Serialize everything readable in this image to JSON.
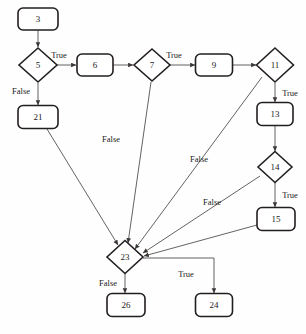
{
  "diagram": {
    "type": "control-flow-graph",
    "background_color": "#fefefe",
    "node_stroke_color": "#231f20",
    "edge_stroke_color": "#55514f",
    "nodes": [
      {
        "id": "n3",
        "label": "3",
        "shape": "rounded-rect",
        "cx": 38,
        "cy": 19,
        "w": 40,
        "h": 22
      },
      {
        "id": "n5",
        "label": "5",
        "shape": "diamond",
        "cx": 38,
        "cy": 65,
        "w": 38,
        "h": 34
      },
      {
        "id": "n21",
        "label": "21",
        "shape": "rounded-rect",
        "cx": 38,
        "cy": 117,
        "w": 40,
        "h": 23
      },
      {
        "id": "n6",
        "label": "6",
        "shape": "rounded-rect",
        "cx": 95,
        "cy": 65,
        "w": 36,
        "h": 22
      },
      {
        "id": "n7",
        "label": "7",
        "shape": "diamond",
        "cx": 152,
        "cy": 65,
        "w": 36,
        "h": 32
      },
      {
        "id": "n9",
        "label": "9",
        "shape": "rounded-rect",
        "cx": 214,
        "cy": 65,
        "w": 37,
        "h": 22
      },
      {
        "id": "n11",
        "label": "11",
        "shape": "diamond",
        "cx": 275,
        "cy": 65,
        "w": 37,
        "h": 34
      },
      {
        "id": "n13",
        "label": "13",
        "shape": "rounded-rect",
        "cx": 275,
        "cy": 114,
        "w": 36,
        "h": 23
      },
      {
        "id": "n14",
        "label": "14",
        "shape": "diamond",
        "cx": 275,
        "cy": 167,
        "w": 34,
        "h": 31
      },
      {
        "id": "n15",
        "label": "15",
        "shape": "rounded-rect",
        "cx": 276,
        "cy": 219,
        "w": 38,
        "h": 23
      },
      {
        "id": "n23",
        "label": "23",
        "shape": "diamond",
        "cx": 125,
        "cy": 257,
        "w": 36,
        "h": 33
      },
      {
        "id": "n26",
        "label": "26",
        "shape": "rounded-rect",
        "cx": 126,
        "cy": 305,
        "w": 38,
        "h": 23
      },
      {
        "id": "n24",
        "label": "24",
        "shape": "rounded-rect",
        "cx": 214,
        "cy": 305,
        "w": 37,
        "h": 23
      }
    ],
    "edges": [
      {
        "id": "e3-5",
        "from": "n3",
        "to": "n5",
        "label": "",
        "label_x": 0,
        "label_y": 0,
        "path": "M 38 30 L 38 47"
      },
      {
        "id": "e5-6",
        "from": "n5",
        "to": "n6",
        "label": "True",
        "label_x": 59,
        "label_y": 56,
        "path": "M 57 65 L 76 65"
      },
      {
        "id": "e5-21",
        "from": "n5",
        "to": "n21",
        "label": "False",
        "label_x": 21,
        "label_y": 92,
        "path": "M 38 83 L 38 105"
      },
      {
        "id": "e6-7",
        "from": "n6",
        "to": "n7",
        "label": "",
        "label_x": 0,
        "label_y": 0,
        "path": "M 113 65 L 133 65"
      },
      {
        "id": "e7-9",
        "from": "n7",
        "to": "n9",
        "label": "True",
        "label_x": 174,
        "label_y": 56,
        "path": "M 170 65 L 195 65"
      },
      {
        "id": "e9-11",
        "from": "n9",
        "to": "n11",
        "label": "",
        "label_x": 0,
        "label_y": 0,
        "path": "M 233 65 L 256 65"
      },
      {
        "id": "e11-13",
        "from": "n11",
        "to": "n13",
        "label": "True",
        "label_x": 290,
        "label_y": 94,
        "path": "M 275 83 L 275 102"
      },
      {
        "id": "e13-14",
        "from": "n13",
        "to": "n14",
        "label": "",
        "label_x": 0,
        "label_y": 0,
        "path": "M 275 126 L 275 151"
      },
      {
        "id": "e14-15",
        "from": "n14",
        "to": "n15",
        "label": "True",
        "label_x": 290,
        "label_y": 196,
        "path": "M 275 183 L 275 207"
      },
      {
        "id": "e21-23",
        "from": "n21",
        "to": "n23",
        "label": "",
        "label_x": 0,
        "label_y": 0,
        "path": "M 47 129 L 118 245"
      },
      {
        "id": "e7-23",
        "from": "n7",
        "to": "n23",
        "label": "False",
        "label_x": 111,
        "label_y": 140,
        "path": "M 151 82 L 128 243"
      },
      {
        "id": "e11-23",
        "from": "n11",
        "to": "n23",
        "label": "False",
        "label_x": 199,
        "label_y": 160,
        "path": "M 262 77 L 135 249"
      },
      {
        "id": "e14-23",
        "from": "n14",
        "to": "n23",
        "label": "False",
        "label_x": 212,
        "label_y": 203,
        "path": "M 260 176 L 143 253"
      },
      {
        "id": "e15-23",
        "from": "n15",
        "to": "n23",
        "label": "",
        "label_x": 0,
        "label_y": 0,
        "path": "M 257 225 L 144 256"
      },
      {
        "id": "e23-26",
        "from": "n23",
        "to": "n26",
        "label": "False",
        "label_x": 108,
        "label_y": 284,
        "path": "M 125 274 L 125 293"
      },
      {
        "id": "e23-24",
        "from": "n23",
        "to": "n24",
        "label": "True",
        "label_x": 186,
        "label_y": 275,
        "path": "M 143 258 L 214 258 L 214 293"
      }
    ]
  },
  "caption": {
    "text": ""
  }
}
